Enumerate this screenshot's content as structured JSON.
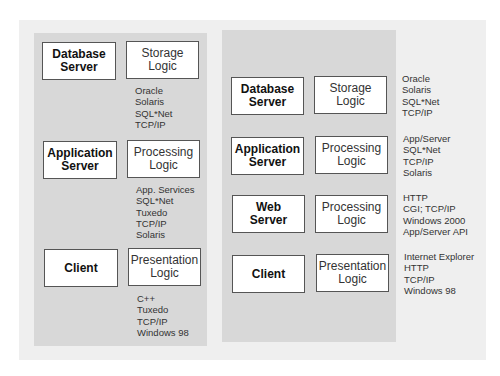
{
  "left": {
    "rows": [
      {
        "tier": "Database\nServer",
        "logic": "Storage\nLogic",
        "notes": "Oracle\nSolaris\nSQL*Net\nTCP/IP"
      },
      {
        "tier": "Application\nServer",
        "logic": "Processing\nLogic",
        "notes": "App. Services\nSQL*Net\nTuxedo\nTCP/IP\nSolaris"
      },
      {
        "tier": "Client",
        "logic": "Presentation\nLogic",
        "notes": "C++\nTuxedo\nTCP/IP\nWindows 98"
      }
    ]
  },
  "right": {
    "rows": [
      {
        "tier": "Database\nServer",
        "logic": "Storage\nLogic",
        "notes": "Oracle\nSolaris\nSQL*Net\nTCP/IP"
      },
      {
        "tier": "Application\nServer",
        "logic": "Processing\nLogic",
        "notes": "App/Server\nSQL*Net\nTCP/IP\nSolaris"
      },
      {
        "tier": "Web\nServer",
        "logic": "Processing\nLogic",
        "notes": "HTTP\nCGI; TCP/IP\nWindows 2000\nApp/Server API"
      },
      {
        "tier": "Client",
        "logic": "Presentation\nLogic",
        "notes": "Internet Explorer\nHTTP\nTCP/IP\nWindows 98"
      }
    ]
  }
}
